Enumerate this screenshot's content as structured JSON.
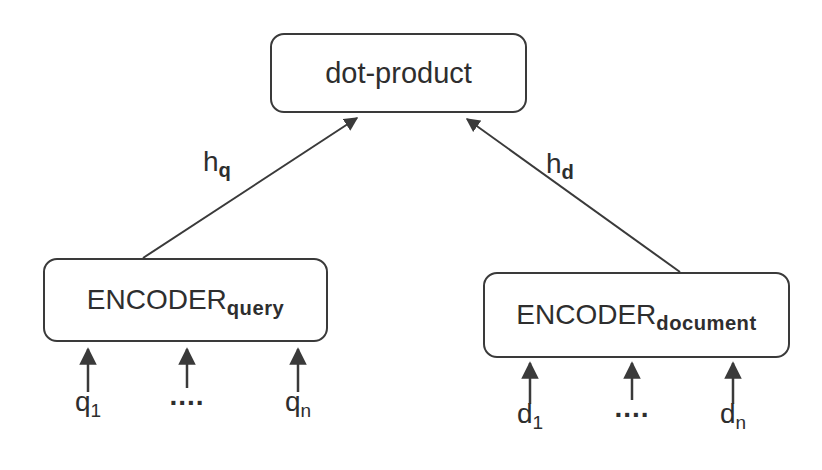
{
  "diagram": {
    "nodes": {
      "dot_product": {
        "label": "dot-product"
      },
      "encoder_query": {
        "base": "ENCODER",
        "sub": "query"
      },
      "encoder_document": {
        "base": "ENCODER",
        "sub": "document"
      }
    },
    "edge_labels": {
      "hq": {
        "base": "h",
        "sub": "q"
      },
      "hd": {
        "base": "h",
        "sub": "d"
      }
    },
    "inputs": {
      "query": [
        {
          "base": "q",
          "sub": "1"
        },
        {
          "base": "....",
          "sub": ""
        },
        {
          "base": "q",
          "sub": "n"
        }
      ],
      "document": [
        {
          "base": "d",
          "sub": "1"
        },
        {
          "base": "....",
          "sub": ""
        },
        {
          "base": "d",
          "sub": "n"
        }
      ]
    },
    "colors": {
      "stroke": "#3a3a3a",
      "text": "#2e2e2e",
      "background": "#ffffff"
    }
  }
}
